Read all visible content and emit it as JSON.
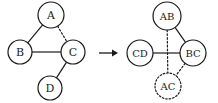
{
  "figure": {
    "background_color": "#ffffff",
    "stroke_color": "#1a1a1a",
    "width": 218,
    "height": 103
  },
  "arrow": {
    "symbol": "→",
    "label": "transforms-to",
    "x1": 99,
    "y1": 53,
    "x2": 118,
    "y2": 53
  },
  "left_graph": {
    "name": "source-graph",
    "nodes": [
      {
        "id": "A",
        "label": "A",
        "cx": 51,
        "cy": 15,
        "r": 13,
        "style": "solid",
        "font_size": 11
      },
      {
        "id": "B",
        "label": "B",
        "cx": 20,
        "cy": 52,
        "r": 12,
        "style": "solid",
        "font_size": 11
      },
      {
        "id": "C",
        "label": "C",
        "cx": 73,
        "cy": 52,
        "r": 12,
        "style": "solid",
        "font_size": 11
      },
      {
        "id": "D",
        "label": "D",
        "cx": 50,
        "cy": 88,
        "r": 12,
        "style": "solid",
        "font_size": 11
      }
    ],
    "edges": [
      {
        "id": "A-B",
        "from": "A",
        "to": "B",
        "style": "solid"
      },
      {
        "id": "A-C",
        "from": "A",
        "to": "C",
        "style": "dotted"
      },
      {
        "id": "B-C",
        "from": "B",
        "to": "C",
        "style": "solid"
      },
      {
        "id": "C-D",
        "from": "C",
        "to": "D",
        "style": "solid"
      }
    ]
  },
  "right_graph": {
    "name": "result-graph",
    "nodes": [
      {
        "id": "AB",
        "label": "AB",
        "cx": 167,
        "cy": 16,
        "r": 14,
        "style": "solid",
        "font_size": 10
      },
      {
        "id": "CD",
        "label": "CD",
        "cx": 140,
        "cy": 53,
        "r": 13,
        "style": "solid",
        "font_size": 10
      },
      {
        "id": "BC",
        "label": "BC",
        "cx": 193,
        "cy": 53,
        "r": 13,
        "style": "solid",
        "font_size": 10
      },
      {
        "id": "AC",
        "label": "AC",
        "cx": 168,
        "cy": 86,
        "r": 13,
        "style": "dotted",
        "font_size": 10
      }
    ],
    "edges": [
      {
        "id": "AB-BC",
        "from": "AB",
        "to": "BC",
        "style": "solid"
      },
      {
        "id": "AB-AC",
        "from": "AB",
        "to": "AC",
        "style": "dotted"
      },
      {
        "id": "CD-BC",
        "from": "CD",
        "to": "BC",
        "style": "solid"
      },
      {
        "id": "BC-AC",
        "from": "BC",
        "to": "AC",
        "style": "dotted"
      }
    ]
  }
}
